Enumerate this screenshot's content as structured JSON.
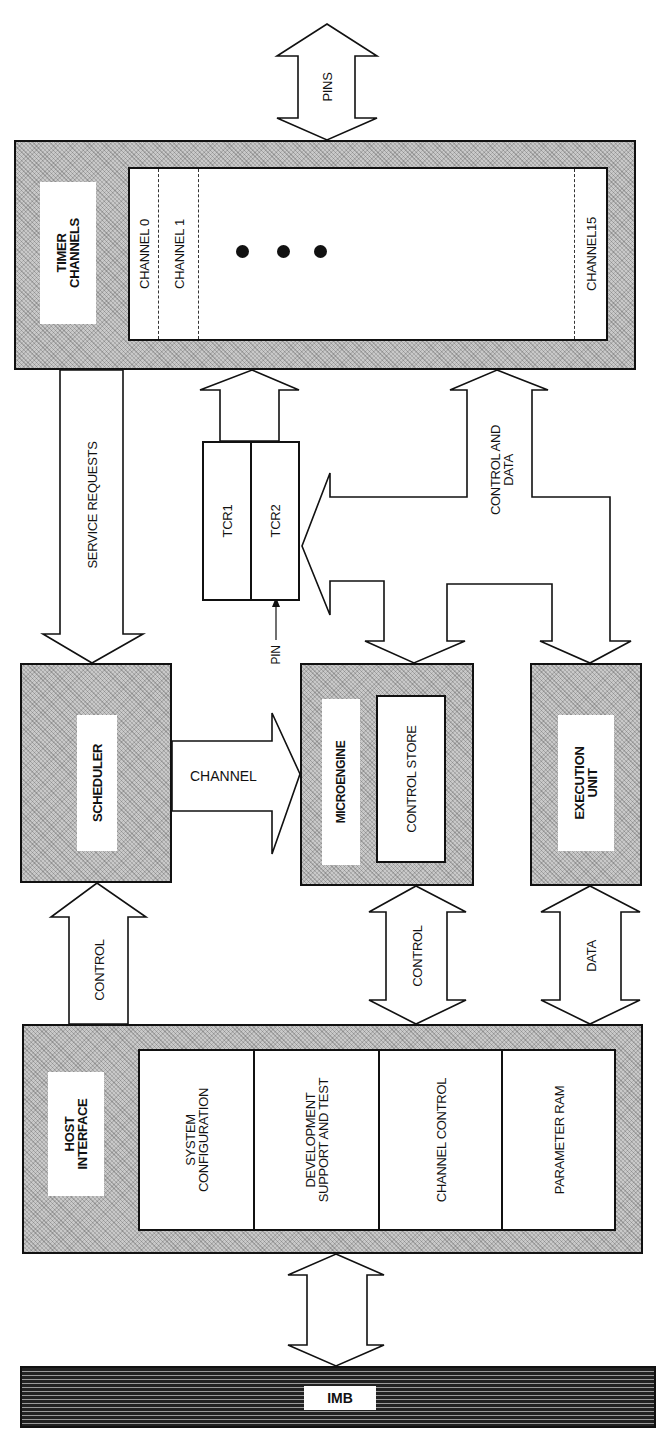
{
  "diagram": {
    "blocks": {
      "timer_channels": {
        "label": "TIMER\nCHANNELS",
        "channels": [
          "CHANNEL 0",
          "CHANNEL 1",
          "CHANNEL15"
        ],
        "ellipsis_dots": 3
      },
      "scheduler": {
        "label": "SCHEDULER"
      },
      "microengine": {
        "label": "MICROENGINE",
        "sub": {
          "control_store": "CONTROL STORE"
        }
      },
      "execution_unit": {
        "label": "EXECUTION\nUNIT"
      },
      "tcr": {
        "tcr1": "TCR1",
        "tcr2": "TCR2",
        "pin": "PIN"
      },
      "host_interface": {
        "label": "HOST\nINTERFACE",
        "sections": [
          "SYSTEM\nCONFIGURATION",
          "DEVELOPMENT\nSUPPORT AND TEST",
          "CHANNEL CONTROL",
          "PARAMETER RAM"
        ]
      },
      "imb": {
        "label": "IMB"
      }
    },
    "arrows": {
      "pins": "PINS",
      "service_requests": "SERVICE REQUESTS",
      "control_and_data": "CONTROL AND\nDATA",
      "channel": "CHANNEL",
      "control_scheduler": "CONTROL",
      "control_microengine": "CONTROL",
      "data_execution": "DATA"
    },
    "colors": {
      "line": "#111111",
      "shade": "#c9c9c9",
      "background": "#ffffff"
    }
  }
}
